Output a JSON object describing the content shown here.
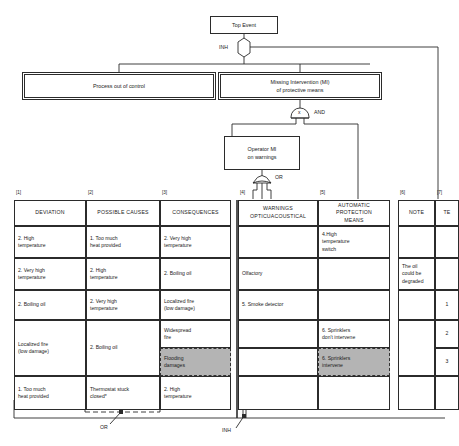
{
  "diagram": {
    "top_event": {
      "label": "Top Event"
    },
    "level1": [
      {
        "id": "process",
        "label": "Process out of control"
      },
      {
        "id": "missing",
        "label": "Missing Intervention (MI)\nof protective means"
      }
    ],
    "operator": {
      "label": "Operator MI\non warnings"
    },
    "gates": [
      {
        "id": "gate-inh-top",
        "type": "INH",
        "label": "INH"
      },
      {
        "id": "gate-and-top",
        "type": "AND",
        "label": "AND",
        "marker": "x"
      },
      {
        "id": "gate-or-operator",
        "type": "OR",
        "label": "OR"
      },
      {
        "id": "gate-and-bottom",
        "type": "AND",
        "label": "AND"
      },
      {
        "id": "gate-not-bottom",
        "type": "NOT",
        "label": "NOT"
      },
      {
        "id": "gate-or-bottom",
        "type": "OR",
        "label": "OR"
      },
      {
        "id": "gate-inh-bottom",
        "type": "INH",
        "label": "INH"
      }
    ]
  },
  "table": {
    "column_numbers": [
      "[1]",
      "[2]",
      "[3]",
      "[4]",
      "[5]",
      "[6]",
      "[7]"
    ],
    "headers": [
      "DEVIATION",
      "POSSIBLE CAUSES",
      "CONSEQUENCES",
      "WARNINGS\nOPTICUACOUSTICAL",
      "AUTOMATIC\nPROTECTION\nMEANS",
      "NOTE",
      "TE"
    ],
    "deviation": [
      "2. High\ntemperature",
      "2. Very high\ntemperature",
      "2. Boiling oil",
      "Localized fire\n(low damage)",
      "1. Too much\nheat provided"
    ],
    "possible_causes": [
      "1. Too much\nheat provided",
      "2. High\ntemperature",
      "2. Very high\ntemperature",
      "2. Boiling oil",
      "Thermostat stuck\nclosed*"
    ],
    "consequences": [
      {
        "text": "2. Very high\ntemperature",
        "shaded": false
      },
      {
        "text": "2. Boiling oil",
        "shaded": false
      },
      {
        "text": "Localized fire\n(low damage)",
        "shaded": false
      },
      {
        "text": "Widespread\nfire",
        "shaded": false
      },
      {
        "text": "Flooding\ndamages",
        "shaded": true
      },
      {
        "text": "2. High\ntemperature",
        "shaded": false
      }
    ],
    "warnings": [
      {
        "text": "",
        "shaded": false
      },
      {
        "text": "Olfactory",
        "shaded": false
      },
      {
        "text": "5. Smoke detector",
        "shaded": false
      },
      {
        "text": "",
        "shaded": false
      },
      {
        "text": "",
        "shaded": false
      },
      {
        "text": "",
        "shaded": false
      }
    ],
    "protection_means": [
      {
        "text": "4.High\ntemperature\nswitch",
        "shaded": false
      },
      {
        "text": "",
        "shaded": false
      },
      {
        "text": "",
        "shaded": false
      },
      {
        "text": "6. Sprinklers\ndon't intervene",
        "shaded": false
      },
      {
        "text": "6. Sprinklers\nintervene",
        "shaded": true
      },
      {
        "text": "",
        "shaded": false
      }
    ],
    "note": [
      "",
      "The oil\ncould be\ndegraded",
      "",
      "",
      ""
    ],
    "te": [
      "",
      "",
      "1",
      "2",
      "3",
      ""
    ]
  },
  "annotations": {
    "and_bottom": "AND",
    "not_bottom": "NOT",
    "or_bottom": "OR",
    "inh_bottom": "INH",
    "footnote_marker": "*"
  }
}
